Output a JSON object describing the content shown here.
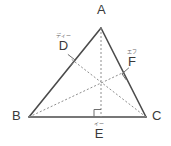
{
  "figure": {
    "background_color": "#ffffff",
    "solid_stroke_color": "#4b4b4b",
    "dashed_stroke_color": "#8e8e8e",
    "right_angle_color": "#6e6e6e",
    "label_color": "#3a3a3a",
    "ruby_color": "#6a6a6a",
    "solid_stroke_width": 1.6,
    "dashed_stroke_width": 1,
    "dash_pattern": "2,2"
  },
  "vertices": {
    "A": {
      "label": "A",
      "ruby": "",
      "x": 101,
      "y": 28,
      "label_x": 97,
      "label_y": 3
    },
    "B": {
      "label": "B",
      "ruby": "",
      "x": 29,
      "y": 117,
      "label_x": 12,
      "label_y": 109
    },
    "C": {
      "label": "C",
      "ruby": "",
      "x": 146,
      "y": 117,
      "label_x": 152,
      "label_y": 109
    }
  },
  "feet": {
    "D": {
      "label": "D",
      "ruby": "ディー",
      "on_side": "AB",
      "x": 70.5,
      "y": 58.5,
      "label_x": 56,
      "label_y": 33
    },
    "E": {
      "label": "E",
      "ruby": "イー",
      "on_side": "BC",
      "x": 101,
      "y": 117,
      "label_x": 94,
      "label_y": 121
    },
    "F": {
      "label": "F",
      "ruby": "エフ",
      "on_side": "AC",
      "x": 125.5,
      "y": 71.5,
      "label_x": 129,
      "label_y": 49
    }
  },
  "orthocenter": {
    "label": "",
    "x": 101,
    "y": 79.5
  },
  "sides": [
    {
      "name": "AB",
      "from": "A",
      "to": "B",
      "style": "solid"
    },
    {
      "name": "AC",
      "from": "A",
      "to": "C",
      "style": "solid"
    },
    {
      "name": "BC",
      "from": "B",
      "to": "C",
      "style": "solid"
    }
  ],
  "altitudes": [
    {
      "name": "AE",
      "from": "A",
      "to": "E",
      "style": "dashed"
    },
    {
      "name": "BF",
      "from": "B",
      "to": "F",
      "style": "dashed"
    },
    {
      "name": "CD",
      "from": "C",
      "to": "D",
      "style": "dashed"
    }
  ],
  "right_angle_marks": [
    {
      "at": "D",
      "label": "right-angle-mark-d"
    },
    {
      "at": "E",
      "label": "right-angle-mark-e"
    },
    {
      "at": "F",
      "label": "right-angle-mark-f"
    }
  ]
}
